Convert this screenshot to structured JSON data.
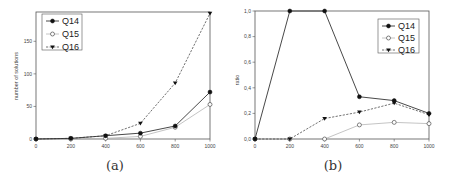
{
  "chart_data": [
    {
      "type": "line",
      "panel": "a",
      "caption": "(a)",
      "title": "",
      "xlabel": "",
      "ylabel": "number of solutions",
      "x": [
        0,
        200,
        400,
        600,
        800,
        1000
      ],
      "xticks": [
        "0",
        "200",
        "400",
        "600",
        "800",
        "1000"
      ],
      "yticks": [
        "0",
        "50",
        "100",
        "150"
      ],
      "xlim": [
        0,
        1000
      ],
      "ylim": [
        0,
        195
      ],
      "grid": false,
      "legend_position": "upper left",
      "series": [
        {
          "name": "Q14",
          "values": [
            0,
            1,
            5,
            9,
            20,
            72
          ],
          "marker": "filled-circle",
          "line": "solid",
          "color": "#222222"
        },
        {
          "name": "Q15",
          "values": [
            0,
            0,
            1,
            4,
            18,
            53
          ],
          "marker": "open-circle",
          "line": "solid-light",
          "color": "#aaaaaa"
        },
        {
          "name": "Q16",
          "values": [
            0,
            1,
            5,
            24,
            86,
            193
          ],
          "marker": "down-triangle",
          "line": "dashed",
          "color": "#333333"
        }
      ]
    },
    {
      "type": "line",
      "panel": "b",
      "caption": "(b)",
      "title": "",
      "xlabel": "",
      "ylabel": "ratio",
      "x": [
        0,
        200,
        400,
        600,
        800,
        1000
      ],
      "xticks": [
        "0",
        "200",
        "400",
        "600",
        "800",
        "1000"
      ],
      "yticks": [
        "0,0",
        "0,2",
        "0,4",
        "0,6",
        "0,8",
        "1,0"
      ],
      "xlim": [
        0,
        1000
      ],
      "ylim": [
        0,
        1.0
      ],
      "grid": false,
      "legend_position": "upper right",
      "series": [
        {
          "name": "Q14",
          "values": [
            0,
            1.0,
            1.0,
            0.33,
            0.3,
            0.2
          ],
          "marker": "filled-circle",
          "line": "solid",
          "color": "#222222"
        },
        {
          "name": "Q15",
          "values": [
            0,
            0,
            0,
            0.11,
            0.13,
            0.12
          ],
          "marker": "open-circle",
          "line": "solid-light",
          "color": "#aaaaaa"
        },
        {
          "name": "Q16",
          "values": [
            0,
            0,
            0.16,
            0.21,
            0.28,
            0.19
          ],
          "marker": "down-triangle",
          "line": "dashed",
          "color": "#333333"
        }
      ]
    }
  ]
}
